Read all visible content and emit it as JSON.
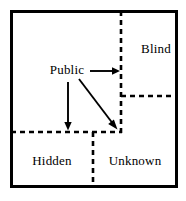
{
  "diagram": {
    "type": "quadrant-window",
    "stroke_color": "#000000",
    "background_color": "#ffffff",
    "border": {
      "style": "solid",
      "x": 10,
      "y": 10,
      "width": 168,
      "height": 178
    },
    "regions": [
      {
        "id": "blind",
        "label": "Blind",
        "position": "top-right",
        "label_x": 156,
        "label_y": 53
      },
      {
        "id": "public",
        "label": "Public",
        "position": "top-left",
        "label_x": 67,
        "label_y": 74
      },
      {
        "id": "hidden",
        "label": "Hidden",
        "position": "bottom-left",
        "label_x": 52,
        "label_y": 165
      },
      {
        "id": "unknown",
        "label": "Unknown",
        "position": "bottom-right",
        "label_x": 135,
        "label_y": 165
      }
    ],
    "dividers": [
      {
        "id": "vertical-upper",
        "orientation": "vertical",
        "style": "dashed",
        "x1": 121,
        "y1": 11,
        "x2": 121,
        "y2": 133
      },
      {
        "id": "horizontal-left",
        "orientation": "horizontal",
        "style": "dashed",
        "x1": 11,
        "y1": 132,
        "x2": 122,
        "y2": 132
      },
      {
        "id": "horizontal-right",
        "orientation": "horizontal",
        "style": "dashed",
        "x1": 121,
        "y1": 96,
        "x2": 177,
        "y2": 96
      },
      {
        "id": "vertical-lower",
        "orientation": "vertical",
        "style": "dashed",
        "x1": 93,
        "y1": 132,
        "x2": 93,
        "y2": 187
      }
    ],
    "arrows": [
      {
        "id": "public-to-blind",
        "from": "public",
        "to": "blind",
        "direction": "right",
        "x1": 90,
        "y1": 71,
        "x2": 120,
        "y2": 71
      },
      {
        "id": "public-to-hidden",
        "from": "public",
        "to": "hidden",
        "direction": "down",
        "x1": 68,
        "y1": 82,
        "x2": 68,
        "y2": 130
      },
      {
        "id": "public-to-unknown",
        "from": "public",
        "to": "unknown",
        "direction": "down-right-diagonal",
        "x1": 79,
        "y1": 79,
        "x2": 117,
        "y2": 129
      }
    ]
  }
}
